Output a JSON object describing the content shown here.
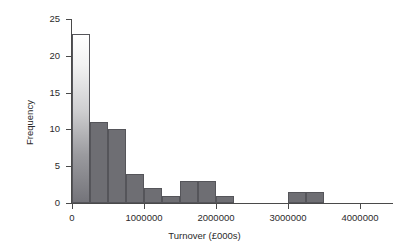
{
  "chart_data": {
    "type": "bar",
    "title": "",
    "subtitle": "",
    "xlabel": "Turnover (£000s)",
    "ylabel": "Frequency",
    "xlim": [
      -100000,
      4150000
    ],
    "ylim": [
      0,
      25
    ],
    "grid": false,
    "legend": null,
    "bin_width": 250000,
    "xticks": [
      0,
      1000000,
      2000000,
      3000000,
      4000000
    ],
    "xtick_labels": [
      "0",
      "1000000",
      "2000000",
      "3000000",
      "4000000"
    ],
    "yticks": [
      0,
      5,
      10,
      15,
      20,
      25
    ],
    "ytick_labels": [
      "0",
      "5",
      "10",
      "15",
      "20",
      "25"
    ],
    "bin_starts": [
      0,
      250000,
      500000,
      750000,
      1000000,
      1250000,
      1500000,
      1750000,
      2000000,
      2250000,
      2500000,
      2750000,
      3000000,
      3250000
    ],
    "values": [
      23,
      11,
      10,
      4,
      2,
      1,
      3,
      3,
      1,
      0,
      0,
      0,
      1.5,
      1.5
    ],
    "bar_fill_color": "#6e6e73",
    "bar_edge_color": "#55555a",
    "first_bar_gradient": true,
    "axis_color": "#4a4a4a"
  },
  "axis": {
    "y_title": "Frequency",
    "x_title": "Turnover (£000s)"
  }
}
